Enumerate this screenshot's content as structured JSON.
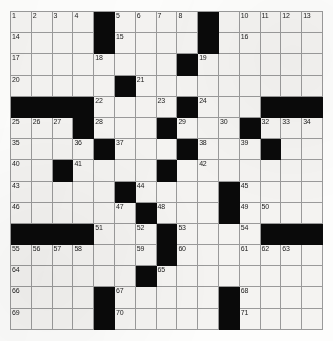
{
  "puzzle": {
    "type": "crossword-grid",
    "rows": 15,
    "columns": 15,
    "cell_size_px": 21,
    "colors": {
      "block": "#000000",
      "cell": "#f4f3f1",
      "grid_line": "#9a9a9a",
      "number_text": "#1a1a1a",
      "page_background": "#ffffff"
    },
    "blocks": [
      [
        0,
        4
      ],
      [
        0,
        9
      ],
      [
        1,
        4
      ],
      [
        1,
        9
      ],
      [
        2,
        8
      ],
      [
        3,
        5
      ],
      [
        4,
        0
      ],
      [
        4,
        1
      ],
      [
        4,
        2
      ],
      [
        4,
        3
      ],
      [
        4,
        8
      ],
      [
        4,
        12
      ],
      [
        4,
        13
      ],
      [
        4,
        14
      ],
      [
        5,
        3
      ],
      [
        5,
        7
      ],
      [
        5,
        11
      ],
      [
        6,
        4
      ],
      [
        6,
        8
      ],
      [
        6,
        12
      ],
      [
        7,
        2
      ],
      [
        7,
        7
      ],
      [
        8,
        5
      ],
      [
        8,
        10
      ],
      [
        9,
        6
      ],
      [
        9,
        10
      ],
      [
        10,
        0
      ],
      [
        10,
        1
      ],
      [
        10,
        2
      ],
      [
        10,
        3
      ],
      [
        10,
        7
      ],
      [
        10,
        12
      ],
      [
        10,
        13
      ],
      [
        10,
        14
      ],
      [
        11,
        7
      ],
      [
        12,
        6
      ],
      [
        13,
        4
      ],
      [
        13,
        10
      ],
      [
        14,
        4
      ],
      [
        14,
        10
      ]
    ],
    "numbers": [
      {
        "n": 1,
        "row": 0,
        "col": 0
      },
      {
        "n": 2,
        "row": 0,
        "col": 1
      },
      {
        "n": 3,
        "row": 0,
        "col": 2
      },
      {
        "n": 4,
        "row": 0,
        "col": 3
      },
      {
        "n": 5,
        "row": 0,
        "col": 5
      },
      {
        "n": 6,
        "row": 0,
        "col": 6
      },
      {
        "n": 7,
        "row": 0,
        "col": 7
      },
      {
        "n": 8,
        "row": 0,
        "col": 8
      },
      {
        "n": 9,
        "row": 0,
        "col": 9
      },
      {
        "n": 10,
        "row": 0,
        "col": 11
      },
      {
        "n": 11,
        "row": 0,
        "col": 12
      },
      {
        "n": 12,
        "row": 0,
        "col": 13
      },
      {
        "n": 13,
        "row": 0,
        "col": 14
      },
      {
        "n": 14,
        "row": 1,
        "col": 0
      },
      {
        "n": 15,
        "row": 1,
        "col": 5
      },
      {
        "n": 16,
        "row": 1,
        "col": 11
      },
      {
        "n": 17,
        "row": 2,
        "col": 0
      },
      {
        "n": 18,
        "row": 2,
        "col": 4
      },
      {
        "n": 19,
        "row": 2,
        "col": 9
      },
      {
        "n": 20,
        "row": 3,
        "col": 0
      },
      {
        "n": 21,
        "row": 3,
        "col": 6
      },
      {
        "n": 22,
        "row": 4,
        "col": 4
      },
      {
        "n": 23,
        "row": 4,
        "col": 7
      },
      {
        "n": 24,
        "row": 4,
        "col": 9
      },
      {
        "n": 25,
        "row": 5,
        "col": 0
      },
      {
        "n": 26,
        "row": 5,
        "col": 1
      },
      {
        "n": 27,
        "row": 5,
        "col": 2
      },
      {
        "n": 28,
        "row": 5,
        "col": 4
      },
      {
        "n": 29,
        "row": 5,
        "col": 8
      },
      {
        "n": 30,
        "row": 5,
        "col": 10
      },
      {
        "n": 31,
        "row": 5,
        "col": 11
      },
      {
        "n": 32,
        "row": 5,
        "col": 12
      },
      {
        "n": 33,
        "row": 5,
        "col": 13
      },
      {
        "n": 34,
        "row": 5,
        "col": 14
      },
      {
        "n": 35,
        "row": 6,
        "col": 0
      },
      {
        "n": 36,
        "row": 6,
        "col": 3
      },
      {
        "n": 37,
        "row": 6,
        "col": 5
      },
      {
        "n": 38,
        "row": 6,
        "col": 9
      },
      {
        "n": 39,
        "row": 6,
        "col": 11
      },
      {
        "n": 40,
        "row": 7,
        "col": 0
      },
      {
        "n": 41,
        "row": 7,
        "col": 3
      },
      {
        "n": 42,
        "row": 7,
        "col": 9
      },
      {
        "n": 43,
        "row": 8,
        "col": 0
      },
      {
        "n": 44,
        "row": 8,
        "col": 6
      },
      {
        "n": 45,
        "row": 8,
        "col": 11
      },
      {
        "n": 46,
        "row": 9,
        "col": 0
      },
      {
        "n": 47,
        "row": 9,
        "col": 5
      },
      {
        "n": 48,
        "row": 9,
        "col": 7
      },
      {
        "n": 49,
        "row": 9,
        "col": 11
      },
      {
        "n": 50,
        "row": 9,
        "col": 12
      },
      {
        "n": 51,
        "row": 10,
        "col": 4
      },
      {
        "n": 52,
        "row": 10,
        "col": 6
      },
      {
        "n": 53,
        "row": 10,
        "col": 8
      },
      {
        "n": 54,
        "row": 10,
        "col": 11
      },
      {
        "n": 55,
        "row": 11,
        "col": 0
      },
      {
        "n": 56,
        "row": 11,
        "col": 1
      },
      {
        "n": 57,
        "row": 11,
        "col": 2
      },
      {
        "n": 58,
        "row": 11,
        "col": 3
      },
      {
        "n": 59,
        "row": 11,
        "col": 6
      },
      {
        "n": 60,
        "row": 11,
        "col": 8
      },
      {
        "n": 61,
        "row": 11,
        "col": 11
      },
      {
        "n": 62,
        "row": 11,
        "col": 12
      },
      {
        "n": 63,
        "row": 11,
        "col": 13
      },
      {
        "n": 64,
        "row": 12,
        "col": 0
      },
      {
        "n": 65,
        "row": 12,
        "col": 7
      },
      {
        "n": 66,
        "row": 13,
        "col": 0
      },
      {
        "n": 67,
        "row": 13,
        "col": 5
      },
      {
        "n": 68,
        "row": 13,
        "col": 11
      },
      {
        "n": 69,
        "row": 14,
        "col": 0
      },
      {
        "n": 70,
        "row": 14,
        "col": 5
      },
      {
        "n": 71,
        "row": 14,
        "col": 11
      }
    ]
  }
}
